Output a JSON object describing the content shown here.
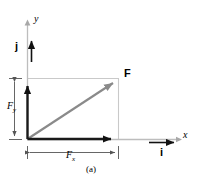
{
  "figure": {
    "caption": "(a)",
    "colors": {
      "axis": "#b3b3b3",
      "construction": "#c8c8c8",
      "resultant_vector": "#808080",
      "component_vector": "#1a1a1a",
      "unit_vector": "#000000",
      "dimension_line": "#4d4d4d",
      "text": "#000000",
      "background": "#ffffff"
    }
  },
  "axes": {
    "x_label": "x",
    "y_label": "y",
    "origin": {
      "x": 27,
      "y": 139
    },
    "x_axis_end": {
      "x": 181,
      "y": 139
    },
    "y_axis_top": {
      "x": 27,
      "y": 22
    }
  },
  "unit_vectors": [
    {
      "name": "j-unit-vector",
      "label": "j",
      "direction": "up",
      "tail": {
        "x": 27,
        "y": 62
      },
      "tip": {
        "x": 27,
        "y": 34
      }
    },
    {
      "name": "i-unit-vector",
      "label": "i",
      "direction": "right",
      "tail": {
        "x": 150,
        "y": 142
      },
      "tip": {
        "x": 181,
        "y": 142
      }
    }
  ],
  "vectors": [
    {
      "name": "force-resultant",
      "label": "F",
      "tail": {
        "x": 27,
        "y": 139
      },
      "tip": {
        "x": 118,
        "y": 79
      }
    },
    {
      "name": "force-y-component",
      "label": "F_y",
      "tail": {
        "x": 27,
        "y": 139
      },
      "tip": {
        "x": 27,
        "y": 79
      }
    },
    {
      "name": "force-x-component",
      "label": "F_x",
      "tail": {
        "x": 27,
        "y": 139
      },
      "tip": {
        "x": 118,
        "y": 139
      }
    }
  ],
  "component_labels": {
    "x_symbol": "F",
    "x_subscript": "x",
    "y_symbol": "F",
    "y_subscript": "y"
  },
  "dimension_lines": [
    {
      "name": "fy-dimension",
      "orientation": "vertical",
      "from": {
        "x": 14,
        "y": 79
      },
      "to": {
        "x": 14,
        "y": 139
      }
    },
    {
      "name": "fx-dimension",
      "orientation": "horizontal",
      "from": {
        "x": 27,
        "y": 152
      },
      "to": {
        "x": 118,
        "y": 152
      }
    }
  ],
  "construction_lines": [
    {
      "name": "projection-top",
      "from": {
        "x": 27,
        "y": 79
      },
      "to": {
        "x": 118,
        "y": 79
      }
    },
    {
      "name": "projection-right",
      "from": {
        "x": 118,
        "y": 79
      },
      "to": {
        "x": 118,
        "y": 139
      }
    }
  ]
}
